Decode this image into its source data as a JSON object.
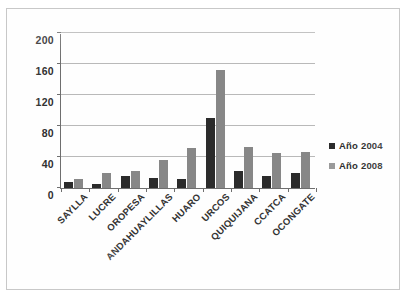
{
  "chart_data": {
    "type": "bar",
    "title": "",
    "subtitle": "",
    "xlabel": "",
    "ylabel": "",
    "ylim": [
      0,
      200
    ],
    "yticks": [
      0,
      40,
      80,
      120,
      160,
      200
    ],
    "grid": true,
    "legend_position": "right",
    "categories": [
      "SAYLLA",
      "LUCRE",
      "OROPESA",
      "ANDAHUAYLILLAS",
      "HUARO",
      "URCOS",
      "QUIQUIJANA",
      "CCATCA",
      "OCONGATE"
    ],
    "series": [
      {
        "name": "Año 2004",
        "color": "#2b2b2b",
        "values": [
          8,
          5,
          15,
          13,
          11,
          90,
          22,
          15,
          20
        ]
      },
      {
        "name": "Año 2008",
        "color": "#878787",
        "values": [
          11,
          20,
          22,
          36,
          51,
          152,
          53,
          45,
          46
        ]
      }
    ]
  },
  "legend": {
    "items": [
      {
        "label": "Año 2004",
        "swatch": "dark-square"
      },
      {
        "label": "Año 2008",
        "swatch": "gray-square"
      }
    ]
  },
  "axis": {
    "y_tick_labels": [
      "0",
      "40",
      "80",
      "120",
      "160",
      "200"
    ]
  }
}
